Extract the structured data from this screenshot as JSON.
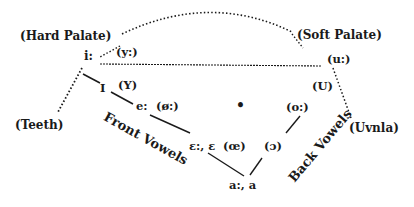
{
  "diagram": {
    "type": "vowel-chart",
    "places": {
      "hard_palate": "(Hard Palate)",
      "soft_palate": "(Soft Palate)",
      "teeth": "(Teeth)",
      "uvula": "(Uvnla)"
    },
    "axes": {
      "front": "Front Vowels",
      "back": "Back Vowels"
    },
    "vowels": {
      "i_long": "i:",
      "y_long": "(y:)",
      "u_long": "(u:)",
      "I_short": "I",
      "Y_short": "(Y)",
      "U_short": "(U)",
      "e_long": "e:",
      "oe_long": "(ø:)",
      "o_long": "(o:)",
      "eps": "ɛ:, ɛ",
      "ae": "(œ)",
      "open_o": "(ɔ)",
      "a": "a:, a",
      "schwa_dot": "•"
    },
    "colors": {
      "ink": "#1a1a1a",
      "background": "#ffffff"
    }
  }
}
